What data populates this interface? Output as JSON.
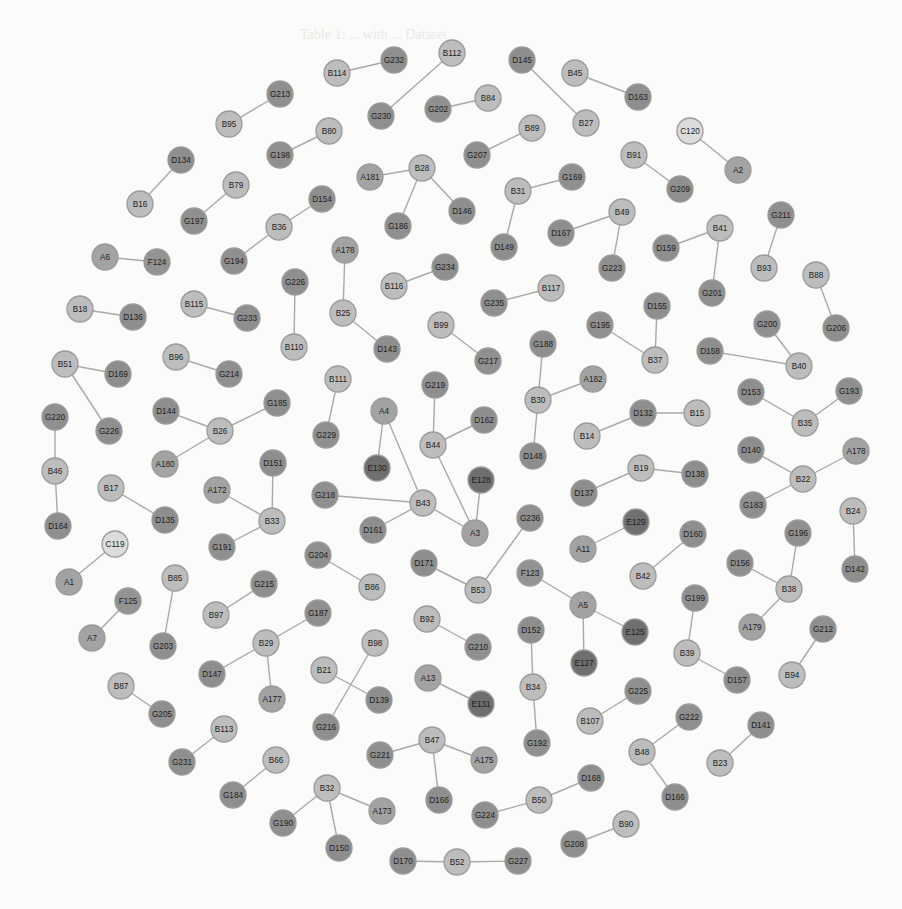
{
  "figure": {
    "type": "network-graph",
    "background": "#fbfbfa",
    "caption_bleed": "Table 1: ... with ... Dataset",
    "node_radius": 13,
    "type_colors": {
      "A": "#a3a3a3",
      "B": "#bdbdbd",
      "C": "#dcdcdc",
      "D": "#8e8e8e",
      "E": "#6f6f6f",
      "F": "#939393",
      "G": "#8f8f8f"
    }
  },
  "nodes": [
    {
      "id": "B114",
      "x": 337,
      "y": 73
    },
    {
      "id": "G232",
      "x": 394,
      "y": 60
    },
    {
      "id": "B112",
      "x": 452,
      "y": 53
    },
    {
      "id": "G230",
      "x": 381,
      "y": 116
    },
    {
      "id": "G202",
      "x": 438,
      "y": 109
    },
    {
      "id": "B84",
      "x": 488,
      "y": 98
    },
    {
      "id": "D145",
      "x": 522,
      "y": 60
    },
    {
      "id": "B27",
      "x": 586,
      "y": 123
    },
    {
      "id": "B45",
      "x": 575,
      "y": 73
    },
    {
      "id": "D163",
      "x": 638,
      "y": 97
    },
    {
      "id": "G213",
      "x": 280,
      "y": 94
    },
    {
      "id": "B95",
      "x": 229,
      "y": 124
    },
    {
      "id": "B80",
      "x": 329,
      "y": 131
    },
    {
      "id": "G198",
      "x": 280,
      "y": 155
    },
    {
      "id": "B89",
      "x": 532,
      "y": 128
    },
    {
      "id": "G207",
      "x": 477,
      "y": 155
    },
    {
      "id": "C120",
      "x": 690,
      "y": 131
    },
    {
      "id": "A2",
      "x": 738,
      "y": 170
    },
    {
      "id": "B91",
      "x": 634,
      "y": 155
    },
    {
      "id": "G209",
      "x": 680,
      "y": 189
    },
    {
      "id": "D134",
      "x": 181,
      "y": 160
    },
    {
      "id": "B16",
      "x": 140,
      "y": 204
    },
    {
      "id": "B79",
      "x": 236,
      "y": 185
    },
    {
      "id": "G197",
      "x": 194,
      "y": 221
    },
    {
      "id": "A181",
      "x": 370,
      "y": 177
    },
    {
      "id": "B28",
      "x": 422,
      "y": 168
    },
    {
      "id": "D146",
      "x": 462,
      "y": 211
    },
    {
      "id": "G186",
      "x": 398,
      "y": 226
    },
    {
      "id": "B31",
      "x": 518,
      "y": 191
    },
    {
      "id": "G169",
      "x": 572,
      "y": 177
    },
    {
      "id": "D149",
      "x": 504,
      "y": 247
    },
    {
      "id": "B49",
      "x": 622,
      "y": 212
    },
    {
      "id": "D167",
      "x": 561,
      "y": 233
    },
    {
      "id": "G223",
      "x": 612,
      "y": 268
    },
    {
      "id": "D154",
      "x": 322,
      "y": 199
    },
    {
      "id": "B36",
      "x": 279,
      "y": 227
    },
    {
      "id": "G194",
      "x": 234,
      "y": 261
    },
    {
      "id": "A178",
      "x": 345,
      "y": 250
    },
    {
      "id": "B41",
      "x": 720,
      "y": 228
    },
    {
      "id": "D159",
      "x": 666,
      "y": 248
    },
    {
      "id": "G201",
      "x": 712,
      "y": 293
    },
    {
      "id": "G211",
      "x": 781,
      "y": 215
    },
    {
      "id": "B93",
      "x": 764,
      "y": 268
    },
    {
      "id": "A6",
      "x": 105,
      "y": 257
    },
    {
      "id": "F124",
      "x": 157,
      "y": 262
    },
    {
      "id": "G234",
      "x": 445,
      "y": 267
    },
    {
      "id": "B116",
      "x": 394,
      "y": 286
    },
    {
      "id": "G226",
      "x": 295,
      "y": 282
    },
    {
      "id": "B110",
      "x": 294,
      "y": 347
    },
    {
      "id": "B25",
      "x": 343,
      "y": 313
    },
    {
      "id": "D143",
      "x": 387,
      "y": 349
    },
    {
      "id": "B117",
      "x": 551,
      "y": 288
    },
    {
      "id": "G235",
      "x": 494,
      "y": 303
    },
    {
      "id": "B88",
      "x": 816,
      "y": 275
    },
    {
      "id": "G206",
      "x": 836,
      "y": 328
    },
    {
      "id": "B18",
      "x": 80,
      "y": 309
    },
    {
      "id": "D136",
      "x": 133,
      "y": 317
    },
    {
      "id": "B115",
      "x": 194,
      "y": 304
    },
    {
      "id": "G233",
      "x": 247,
      "y": 318
    },
    {
      "id": "B99",
      "x": 441,
      "y": 325
    },
    {
      "id": "G217",
      "x": 488,
      "y": 361
    },
    {
      "id": "D155",
      "x": 657,
      "y": 306
    },
    {
      "id": "G195",
      "x": 600,
      "y": 325
    },
    {
      "id": "B37",
      "x": 655,
      "y": 360
    },
    {
      "id": "G200",
      "x": 767,
      "y": 324
    },
    {
      "id": "D158",
      "x": 710,
      "y": 351
    },
    {
      "id": "B40",
      "x": 799,
      "y": 366
    },
    {
      "id": "G188",
      "x": 543,
      "y": 344
    },
    {
      "id": "B30",
      "x": 538,
      "y": 400
    },
    {
      "id": "A182",
      "x": 593,
      "y": 379
    },
    {
      "id": "D148",
      "x": 533,
      "y": 456
    },
    {
      "id": "B51",
      "x": 65,
      "y": 364
    },
    {
      "id": "D169",
      "x": 118,
      "y": 374
    },
    {
      "id": "B96",
      "x": 176,
      "y": 357
    },
    {
      "id": "G214",
      "x": 229,
      "y": 374
    },
    {
      "id": "B111",
      "x": 338,
      "y": 379
    },
    {
      "id": "G229",
      "x": 326,
      "y": 435
    },
    {
      "id": "G219",
      "x": 435,
      "y": 385
    },
    {
      "id": "D162",
      "x": 484,
      "y": 420
    },
    {
      "id": "A4",
      "x": 384,
      "y": 411
    },
    {
      "id": "B44",
      "x": 433,
      "y": 445
    },
    {
      "id": "E130",
      "x": 377,
      "y": 468
    },
    {
      "id": "G185",
      "x": 277,
      "y": 403
    },
    {
      "id": "D144",
      "x": 166,
      "y": 411
    },
    {
      "id": "B26",
      "x": 220,
      "y": 431
    },
    {
      "id": "A180",
      "x": 165,
      "y": 464
    },
    {
      "id": "G220",
      "x": 55,
      "y": 417
    },
    {
      "id": "G226b",
      "label": "G226",
      "x": 109,
      "y": 431
    },
    {
      "id": "D132",
      "x": 643,
      "y": 413
    },
    {
      "id": "B15",
      "x": 697,
      "y": 413
    },
    {
      "id": "B14",
      "x": 587,
      "y": 436
    },
    {
      "id": "D153",
      "x": 751,
      "y": 392
    },
    {
      "id": "G193",
      "x": 849,
      "y": 391
    },
    {
      "id": "B35",
      "x": 805,
      "y": 423
    },
    {
      "id": "D140",
      "x": 751,
      "y": 450
    },
    {
      "id": "A178b",
      "label": "A178",
      "x": 856,
      "y": 451
    },
    {
      "id": "B22",
      "x": 803,
      "y": 479
    },
    {
      "id": "D151",
      "x": 273,
      "y": 463
    },
    {
      "id": "B46",
      "x": 55,
      "y": 471
    },
    {
      "id": "B17",
      "x": 111,
      "y": 488
    },
    {
      "id": "D135",
      "x": 165,
      "y": 520
    },
    {
      "id": "A172",
      "x": 217,
      "y": 490
    },
    {
      "id": "B33",
      "x": 272,
      "y": 521
    },
    {
      "id": "G218",
      "x": 325,
      "y": 495
    },
    {
      "id": "B43",
      "x": 423,
      "y": 503
    },
    {
      "id": "D161",
      "x": 373,
      "y": 530
    },
    {
      "id": "E128",
      "x": 481,
      "y": 480
    },
    {
      "id": "A3",
      "x": 475,
      "y": 533
    },
    {
      "id": "B19",
      "x": 641,
      "y": 468
    },
    {
      "id": "D138",
      "x": 695,
      "y": 474
    },
    {
      "id": "D137",
      "x": 584,
      "y": 493
    },
    {
      "id": "G183",
      "x": 753,
      "y": 505
    },
    {
      "id": "B24",
      "x": 853,
      "y": 511
    },
    {
      "id": "D164",
      "x": 58,
      "y": 526
    },
    {
      "id": "G236",
      "x": 530,
      "y": 518
    },
    {
      "id": "E129",
      "x": 636,
      "y": 522
    },
    {
      "id": "D160",
      "x": 693,
      "y": 534
    },
    {
      "id": "G196",
      "x": 798,
      "y": 533
    },
    {
      "id": "C119",
      "x": 115,
      "y": 544
    },
    {
      "id": "G191",
      "x": 222,
      "y": 547
    },
    {
      "id": "G204",
      "x": 318,
      "y": 555
    },
    {
      "id": "B86",
      "x": 372,
      "y": 587
    },
    {
      "id": "D171",
      "x": 424,
      "y": 563
    },
    {
      "id": "A11",
      "x": 583,
      "y": 549
    },
    {
      "id": "D156",
      "x": 740,
      "y": 563
    },
    {
      "id": "D142",
      "x": 855,
      "y": 569
    },
    {
      "id": "B85",
      "x": 175,
      "y": 578
    },
    {
      "id": "G215",
      "x": 264,
      "y": 584
    },
    {
      "id": "A1",
      "x": 69,
      "y": 582
    },
    {
      "id": "B53",
      "x": 478,
      "y": 590
    },
    {
      "id": "F123",
      "x": 530,
      "y": 573
    },
    {
      "id": "B42",
      "x": 643,
      "y": 576
    },
    {
      "id": "B38",
      "x": 789,
      "y": 589
    },
    {
      "id": "F125",
      "x": 128,
      "y": 601
    },
    {
      "id": "B97",
      "x": 216,
      "y": 615
    },
    {
      "id": "G187",
      "x": 318,
      "y": 613
    },
    {
      "id": "A5",
      "x": 583,
      "y": 605
    },
    {
      "id": "G199",
      "x": 695,
      "y": 598
    },
    {
      "id": "A7",
      "x": 92,
      "y": 638
    },
    {
      "id": "G203",
      "x": 163,
      "y": 646
    },
    {
      "id": "B29",
      "x": 266,
      "y": 643
    },
    {
      "id": "B92",
      "x": 427,
      "y": 619
    },
    {
      "id": "G210",
      "x": 478,
      "y": 647
    },
    {
      "id": "D152",
      "x": 531,
      "y": 630
    },
    {
      "id": "E125",
      "x": 635,
      "y": 632
    },
    {
      "id": "A179",
      "x": 752,
      "y": 627
    },
    {
      "id": "G212",
      "x": 823,
      "y": 629
    },
    {
      "id": "B98",
      "x": 375,
      "y": 643
    },
    {
      "id": "B39",
      "x": 687,
      "y": 653
    },
    {
      "id": "D147",
      "x": 212,
      "y": 674
    },
    {
      "id": "B21",
      "x": 324,
      "y": 670
    },
    {
      "id": "A13",
      "x": 428,
      "y": 678
    },
    {
      "id": "B34",
      "x": 533,
      "y": 687
    },
    {
      "id": "E127",
      "x": 584,
      "y": 663
    },
    {
      "id": "D157",
      "x": 737,
      "y": 680
    },
    {
      "id": "B94",
      "x": 792,
      "y": 675
    },
    {
      "id": "B87",
      "x": 121,
      "y": 686
    },
    {
      "id": "A177",
      "x": 272,
      "y": 699
    },
    {
      "id": "D139",
      "x": 379,
      "y": 700
    },
    {
      "id": "E131",
      "x": 481,
      "y": 704
    },
    {
      "id": "G225",
      "x": 638,
      "y": 691
    },
    {
      "id": "G205",
      "x": 162,
      "y": 714
    },
    {
      "id": "B107",
      "x": 590,
      "y": 721
    },
    {
      "id": "D141",
      "x": 761,
      "y": 725
    },
    {
      "id": "G216",
      "x": 326,
      "y": 727
    },
    {
      "id": "B113",
      "x": 224,
      "y": 729
    },
    {
      "id": "G222",
      "x": 689,
      "y": 717
    },
    {
      "id": "G192",
      "x": 537,
      "y": 743
    },
    {
      "id": "B47",
      "x": 432,
      "y": 740
    },
    {
      "id": "G221",
      "x": 380,
      "y": 755
    },
    {
      "id": "A175",
      "x": 484,
      "y": 760
    },
    {
      "id": "B48",
      "x": 642,
      "y": 752
    },
    {
      "id": "B23",
      "x": 720,
      "y": 763
    },
    {
      "id": "G231",
      "x": 182,
      "y": 762
    },
    {
      "id": "B66",
      "x": 276,
      "y": 760
    },
    {
      "id": "B32",
      "x": 327,
      "y": 788
    },
    {
      "id": "G184",
      "x": 233,
      "y": 795
    },
    {
      "id": "D166",
      "x": 439,
      "y": 800
    },
    {
      "id": "D168",
      "x": 591,
      "y": 778
    },
    {
      "id": "A173",
      "x": 382,
      "y": 811
    },
    {
      "id": "B50",
      "x": 539,
      "y": 800
    },
    {
      "id": "D166b",
      "label": "D166",
      "x": 675,
      "y": 797
    },
    {
      "id": "G190",
      "x": 283,
      "y": 823
    },
    {
      "id": "G224",
      "x": 485,
      "y": 815
    },
    {
      "id": "B90",
      "x": 626,
      "y": 824
    },
    {
      "id": "D150",
      "x": 339,
      "y": 848
    },
    {
      "id": "G208",
      "x": 574,
      "y": 844
    },
    {
      "id": "D170",
      "x": 403,
      "y": 861
    },
    {
      "id": "B52",
      "x": 457,
      "y": 862
    },
    {
      "id": "G227",
      "x": 518,
      "y": 861
    }
  ],
  "edges": [
    [
      "B114",
      "G232"
    ],
    [
      "B112",
      "G230"
    ],
    [
      "G202",
      "B84"
    ],
    [
      "D145",
      "B27"
    ],
    [
      "B45",
      "D163"
    ],
    [
      "G213",
      "B95"
    ],
    [
      "B80",
      "G198"
    ],
    [
      "B89",
      "G207"
    ],
    [
      "C120",
      "A2"
    ],
    [
      "B91",
      "G209"
    ],
    [
      "D134",
      "B16"
    ],
    [
      "B79",
      "G197"
    ],
    [
      "A181",
      "B28"
    ],
    [
      "B28",
      "D146"
    ],
    [
      "B28",
      "G186"
    ],
    [
      "B31",
      "G169"
    ],
    [
      "B31",
      "D149"
    ],
    [
      "B49",
      "D167"
    ],
    [
      "B49",
      "G223"
    ],
    [
      "D154",
      "B36"
    ],
    [
      "B36",
      "G194"
    ],
    [
      "A178",
      "B25"
    ],
    [
      "B25",
      "D143"
    ],
    [
      "B41",
      "D159"
    ],
    [
      "B41",
      "G201"
    ],
    [
      "G211",
      "B93"
    ],
    [
      "A6",
      "F124"
    ],
    [
      "G234",
      "B116"
    ],
    [
      "G226",
      "B110"
    ],
    [
      "B117",
      "G235"
    ],
    [
      "B88",
      "G206"
    ],
    [
      "B18",
      "D136"
    ],
    [
      "B115",
      "G233"
    ],
    [
      "B99",
      "G217"
    ],
    [
      "D155",
      "B37"
    ],
    [
      "G195",
      "B37"
    ],
    [
      "G200",
      "B40"
    ],
    [
      "D158",
      "B40"
    ],
    [
      "G188",
      "B30"
    ],
    [
      "B30",
      "A182"
    ],
    [
      "B30",
      "D148"
    ],
    [
      "B51",
      "D169"
    ],
    [
      "B51",
      "G226b"
    ],
    [
      "B96",
      "G214"
    ],
    [
      "B111",
      "G229"
    ],
    [
      "G219",
      "B44"
    ],
    [
      "B44",
      "D162"
    ],
    [
      "B44",
      "A3"
    ],
    [
      "A4",
      "E130"
    ],
    [
      "A4",
      "B43"
    ],
    [
      "G185",
      "B26"
    ],
    [
      "D144",
      "B26"
    ],
    [
      "B26",
      "A180"
    ],
    [
      "G220",
      "B46"
    ],
    [
      "B46",
      "D164"
    ],
    [
      "D132",
      "B15"
    ],
    [
      "D132",
      "B14"
    ],
    [
      "D153",
      "B35"
    ],
    [
      "G193",
      "B35"
    ],
    [
      "D140",
      "B22"
    ],
    [
      "A178b",
      "B22"
    ],
    [
      "B22",
      "G183"
    ],
    [
      "D151",
      "B33"
    ],
    [
      "A172",
      "B33"
    ],
    [
      "B33",
      "G191"
    ],
    [
      "B17",
      "D135"
    ],
    [
      "G218",
      "B43"
    ],
    [
      "B43",
      "D161"
    ],
    [
      "B43",
      "A3"
    ],
    [
      "E128",
      "A3"
    ],
    [
      "B19",
      "D138"
    ],
    [
      "B19",
      "D137"
    ],
    [
      "B24",
      "D142"
    ],
    [
      "G236",
      "B53"
    ],
    [
      "D171",
      "B53"
    ],
    [
      "E129",
      "A11"
    ],
    [
      "D160",
      "B42"
    ],
    [
      "G196",
      "B38"
    ],
    [
      "D156",
      "B38"
    ],
    [
      "B38",
      "A179"
    ],
    [
      "C119",
      "A1"
    ],
    [
      "G204",
      "B86"
    ],
    [
      "B85",
      "G203"
    ],
    [
      "G215",
      "B97"
    ],
    [
      "F125",
      "A7"
    ],
    [
      "F123",
      "A5"
    ],
    [
      "A5",
      "E125"
    ],
    [
      "A5",
      "E127"
    ],
    [
      "G199",
      "B39"
    ],
    [
      "B39",
      "D157"
    ],
    [
      "G212",
      "B94"
    ],
    [
      "G187",
      "B29"
    ],
    [
      "B29",
      "D147"
    ],
    [
      "B29",
      "A177"
    ],
    [
      "B92",
      "G210"
    ],
    [
      "D152",
      "B34"
    ],
    [
      "B34",
      "G192"
    ],
    [
      "B98",
      "G216"
    ],
    [
      "B21",
      "D139"
    ],
    [
      "A13",
      "E131"
    ],
    [
      "B87",
      "G205"
    ],
    [
      "G225",
      "B107"
    ],
    [
      "D141",
      "B23"
    ],
    [
      "G222",
      "B48"
    ],
    [
      "B48",
      "D166b"
    ],
    [
      "B113",
      "G231"
    ],
    [
      "B47",
      "G221"
    ],
    [
      "B47",
      "A175"
    ],
    [
      "B47",
      "D166"
    ],
    [
      "B66",
      "G184"
    ],
    [
      "B32",
      "A173"
    ],
    [
      "B32",
      "G190"
    ],
    [
      "B32",
      "D150"
    ],
    [
      "D168",
      "B50"
    ],
    [
      "B50",
      "G224"
    ],
    [
      "B90",
      "G208"
    ],
    [
      "D170",
      "B52"
    ],
    [
      "B52",
      "G227"
    ]
  ]
}
